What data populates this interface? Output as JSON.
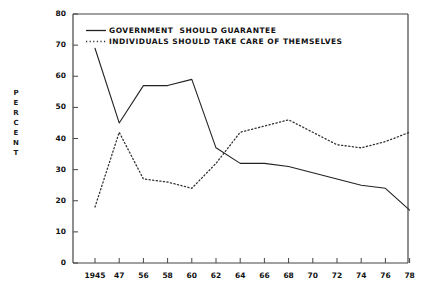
{
  "chart_data": {
    "type": "line",
    "title": "",
    "xlabel": "",
    "ylabel": "PERCENT",
    "ylim": [
      0,
      80
    ],
    "ytick_step": 10,
    "yticks": [
      0,
      10,
      20,
      30,
      40,
      50,
      60,
      70,
      80
    ],
    "categories": [
      "1945",
      "47",
      "56",
      "58",
      "60",
      "62",
      "64",
      "66",
      "68",
      "70",
      "72",
      "74",
      "76",
      "78"
    ],
    "x": [
      1945,
      47,
      56,
      58,
      60,
      62,
      64,
      66,
      68,
      70,
      72,
      74,
      76,
      78
    ],
    "grid": false,
    "legend_position": "top-left",
    "series": [
      {
        "name": "GOVERNMENT  SHOULD GUARANTEE",
        "style": "solid",
        "color": "#222222",
        "values": [
          69,
          45,
          57,
          57,
          59,
          37,
          32,
          32,
          31,
          29,
          27,
          25,
          24,
          17
        ]
      },
      {
        "name": "INDIVIDUALS SHOULD TAKE CARE OF THEMSELVES",
        "style": "dotted",
        "color": "#333333",
        "values": [
          18,
          42,
          27,
          26,
          24,
          32,
          42,
          44,
          46,
          42,
          38,
          37,
          39,
          42
        ]
      }
    ]
  },
  "axis": {
    "y_title_letters": [
      "P",
      "E",
      "R",
      "C",
      "E",
      "N",
      "T"
    ]
  },
  "legend": {
    "items": [
      {
        "label": "GOVERNMENT  SHOULD GUARANTEE",
        "style": "solid"
      },
      {
        "label": "INDIVIDUALS SHOULD TAKE CARE OF THEMSELVES",
        "style": "dotted"
      }
    ]
  },
  "colors": {
    "axis": "#444444",
    "series_solid": "#222222",
    "series_dotted": "#333333",
    "background": "#ffffff",
    "text": "#111111"
  }
}
